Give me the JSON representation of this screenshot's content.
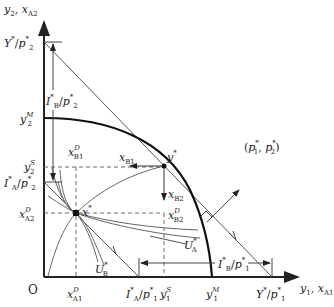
{
  "diagram": {
    "type": "general-equilibrium-edgeworth-ppf",
    "axes": {
      "y_axis": {
        "var": "y",
        "sub": "2",
        "var2": "x",
        "sub2": "A2"
      },
      "x_axis": {
        "var": "y",
        "sub": "1",
        "var2": "x",
        "sub2": "A1"
      },
      "origin": "O"
    },
    "labels": {
      "Y_over_p2": {
        "num": "Y",
        "num_sup": "*",
        "den": "p",
        "den_sub": "2",
        "den_sup": "*"
      },
      "IB_over_p2": {
        "num": "I",
        "num_sup": "*",
        "num_sub": "B",
        "den": "p",
        "den_sub": "2",
        "den_sup": "*"
      },
      "y2M": {
        "var": "y",
        "sub": "2",
        "sup": "M"
      },
      "y2S": {
        "var": "y",
        "sub": "2",
        "sup": "S"
      },
      "IA_over_p2": {
        "num": "I",
        "num_sup": "*",
        "num_sub": "A",
        "den": "p",
        "den_sub": "2",
        "den_sup": "*"
      },
      "xA2D": {
        "var": "x",
        "sub": "A2",
        "sup": "D"
      },
      "xB1D": {
        "var": "x",
        "sub": "B1",
        "sup": "D"
      },
      "xB1": {
        "var": "x",
        "sub": "B1"
      },
      "ystar": {
        "var": "y",
        "sup": "*"
      },
      "xB2": {
        "var": "x",
        "sub": "B2"
      },
      "xB2D": {
        "var": "x",
        "sub": "B2",
        "sup": "D"
      },
      "xstar": {
        "var": "x",
        "sup": "*"
      },
      "price_vector": {
        "text": "(p",
        "p1sub": "1",
        "sup": "*",
        "mid": ", p",
        "p2sub": "2",
        "end": ")"
      },
      "UA": {
        "var": "U",
        "sub": "A",
        "sup": "*"
      },
      "UB": {
        "var": "U",
        "sub": "B",
        "sup": "*"
      },
      "IB_over_p1": {
        "num": "I",
        "num_sup": "*",
        "num_sub": "B",
        "den": "p",
        "den_sub": "1",
        "den_sup": "*"
      },
      "xA1D": {
        "var": "x",
        "sub": "A1",
        "sup": "D"
      },
      "IA_over_p1": {
        "num": "I",
        "num_sup": "*",
        "num_sub": "A",
        "den": "p",
        "den_sub": "1",
        "den_sup": "*"
      },
      "y1S": {
        "var": "y",
        "sub": "1",
        "sup": "S"
      },
      "y1M": {
        "var": "y",
        "sub": "1",
        "sup": "M"
      },
      "Y_over_p1": {
        "num": "Y",
        "num_sup": "*",
        "den": "p",
        "den_sub": "1",
        "den_sup": "*"
      },
      "origin": "O",
      "slash": "/"
    },
    "colors": {
      "axis": "#222222",
      "ppf": "#111111",
      "thin_line": "#555555",
      "dashed": "#666666"
    }
  }
}
